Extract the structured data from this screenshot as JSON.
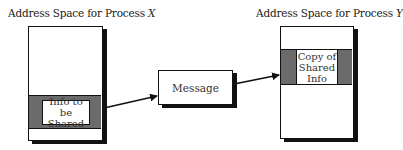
{
  "diagram": {
    "process_x": {
      "title_prefix": "Address Space for Process ",
      "title_var": "X",
      "shared_block_label_line1": "Info to be",
      "shared_block_label_line2": "Shared"
    },
    "message": {
      "label": "Message"
    },
    "process_y": {
      "title_prefix": "Address Space for Process ",
      "title_var": "Y",
      "copy_block_label_line1": "Copy of",
      "copy_block_label_line2": "Shared",
      "copy_block_label_line3": "Info"
    },
    "edges": [
      {
        "from": "process_x.shared_info",
        "to": "message"
      },
      {
        "from": "message",
        "to": "process_y.copy_of_shared_info"
      }
    ],
    "colors": {
      "band": "#6b6b6b",
      "stroke": "#111111",
      "fill": "#ffffff"
    }
  }
}
